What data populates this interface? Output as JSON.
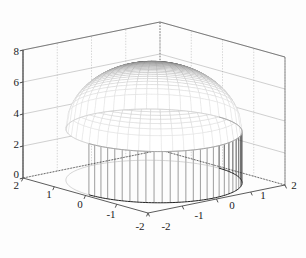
{
  "figure": {
    "type": "3d-surface-plot",
    "background_color": "#fdfdfd",
    "axis_color": "#4a4a4a",
    "grid_color": "#9a9a9a",
    "mesh_dark_color": "#1a1a1a",
    "mesh_light_color": "#d8d8d8",
    "width": 306,
    "height": 258
  },
  "axes": {
    "z": {
      "name": "z-axis",
      "ticks": [
        "8",
        "6",
        "4",
        "2",
        "0"
      ],
      "values": [
        8,
        6,
        4,
        2,
        0
      ],
      "range": [
        0,
        8
      ]
    },
    "y": {
      "name": "y-axis-left-front",
      "ticks": [
        "2",
        "1",
        "0",
        "-1",
        "-2"
      ],
      "values": [
        2,
        1,
        0,
        -1,
        -2
      ],
      "range": [
        -2,
        2
      ]
    },
    "x": {
      "name": "x-axis-right-front",
      "ticks": [
        "-2",
        "-1",
        "0",
        "1",
        "2"
      ],
      "values": [
        -2,
        -1,
        0,
        1,
        2
      ],
      "range": [
        -2,
        2
      ]
    }
  },
  "chart_data": {
    "type": "surface",
    "title": "",
    "xlabel": "",
    "ylabel": "",
    "zlabel": "",
    "xlim": [
      -2,
      2
    ],
    "ylim": [
      -2,
      2
    ],
    "zlim": [
      0,
      8
    ],
    "grid": true,
    "legend": null,
    "surface": {
      "shape": "spherical-cap-dome",
      "apex_z": 7.3,
      "rim_z": 3.2,
      "skirt_bottom_z": 0,
      "domain_radius": 1.9,
      "radial_divisions": 36,
      "angular_divisions": 48,
      "shading": "grayscale-dark-at-apex-light-at-rim"
    },
    "x_ticklabels": [
      "-2",
      "-1",
      "0",
      "1",
      "2"
    ],
    "y_ticklabels": [
      "2",
      "1",
      "0",
      "-1",
      "-2"
    ],
    "z_ticklabels": [
      "0",
      "2",
      "4",
      "6",
      "8"
    ],
    "z_tickvalues": [
      0,
      2,
      4,
      6,
      8
    ]
  }
}
